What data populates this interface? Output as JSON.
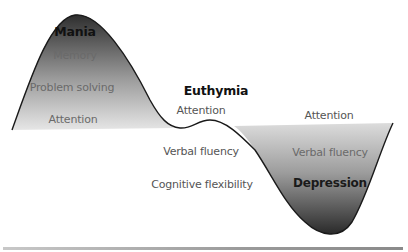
{
  "diagram": {
    "states": [
      {
        "name": "Mania",
        "position": "peak",
        "labels": [
          "Memory",
          "Problem solving",
          "Attention"
        ]
      },
      {
        "name": "Euthymia",
        "position": "baseline",
        "labels_above": [
          "Attention"
        ],
        "labels_below": [
          "Verbal fluency",
          "Cognitive flexibility"
        ]
      },
      {
        "name": "Depression",
        "position": "trough",
        "labels_above": [
          "Attention"
        ],
        "labels": [
          "Verbal fluency"
        ]
      }
    ],
    "colors": {
      "fill_dark": "#3a3a3a",
      "fill_light": "#e4e4e4",
      "outline": "#1a1a1a",
      "baseline_bar": "#9a9a9a"
    }
  }
}
